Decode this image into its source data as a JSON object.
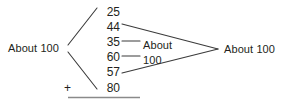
{
  "diagram": {
    "stroke_color": "#3b3b3b",
    "text_color": "#231f20",
    "background_color": "#ffffff",
    "left_label": "About 100",
    "right_label": "About 100",
    "middle_label_line1": "About",
    "middle_label_line2": "100",
    "plus_sign": "+",
    "addends": [
      {
        "value": "25"
      },
      {
        "value": "44"
      },
      {
        "value": "35"
      },
      {
        "value": "60"
      },
      {
        "value": "57"
      },
      {
        "value": "80"
      }
    ]
  }
}
